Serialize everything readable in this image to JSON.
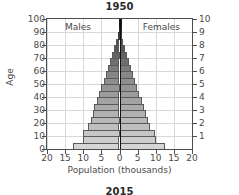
{
  "chart_data": {
    "type": "bar",
    "subtype": "population-pyramid",
    "title": "1950",
    "next_chart_title": "2015",
    "xlabel": "Population (thousands)",
    "ylabel": "Age",
    "grid": true,
    "legend_position": "in-plot",
    "panel_labels": {
      "left": "Males",
      "right": "Females"
    },
    "xlim": [
      -20,
      20
    ],
    "xticks": [
      20,
      15,
      10,
      5,
      0,
      5,
      10,
      15,
      20
    ],
    "ylim": [
      0,
      100
    ],
    "yticks_left": [
      100,
      90,
      80,
      70,
      60,
      50,
      40,
      30,
      20,
      10,
      0
    ],
    "ylabel_right": "",
    "yticks_right": [
      10,
      9,
      8,
      7,
      6,
      5,
      4,
      3,
      2,
      1
    ],
    "age_groups": [
      "0-4",
      "5-9",
      "10-14",
      "15-19",
      "20-24",
      "25-29",
      "30-34",
      "35-39",
      "40-44",
      "45-49",
      "50-54",
      "55-59",
      "60-64",
      "65-69",
      "70-74",
      "75-79",
      "80-84",
      "85-89",
      "90-94",
      "95-99"
    ],
    "series": [
      {
        "name": "Males",
        "side": "left",
        "values": [
          12.8,
          10.2,
          10.0,
          8.6,
          8.0,
          7.4,
          6.9,
          6.3,
          5.6,
          5.0,
          4.4,
          3.8,
          3.2,
          2.6,
          2.0,
          1.4,
          0.9,
          0.5,
          0.25,
          0.1
        ]
      },
      {
        "name": "Females",
        "side": "right",
        "values": [
          12.6,
          10.1,
          9.9,
          8.5,
          7.9,
          7.3,
          6.8,
          6.2,
          5.5,
          4.9,
          4.3,
          3.7,
          3.1,
          2.6,
          2.0,
          1.4,
          0.9,
          0.5,
          0.25,
          0.1
        ]
      }
    ],
    "bar_shades": [
      "#d5d5d5",
      "#cdcdcd",
      "#c6c6c6",
      "#bfbfbf",
      "#b8b8b8",
      "#b1b1b1",
      "#aaaaaa",
      "#a3a3a3",
      "#9c9c9c",
      "#959595",
      "#8e8e8e",
      "#878787",
      "#7b7b7b",
      "#6f6f6f",
      "#636363",
      "#575757",
      "#4a4a4a",
      "#3b3b3b",
      "#2c2c2c",
      "#1a1a1a"
    ],
    "colors": {
      "bar_edge": "#5a5a5a",
      "grid": "#d8d8d8",
      "axis": "#4d4d4d",
      "center_axis": "#111111",
      "text": "#4a4a4a",
      "title": "#2b2b2b",
      "background": "#ffffff"
    }
  }
}
